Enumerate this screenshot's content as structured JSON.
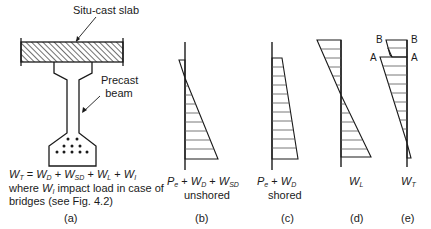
{
  "figure": {
    "panel_a": {
      "slab_label": "Situ-cast slab",
      "beam_label_line1": "Precast",
      "beam_label_line2": "beam",
      "formula": "W_T = W_D + W_SD + W_L + W_I",
      "formula_parts": {
        "wt": "W",
        "wt_sub": "T",
        "eq": " = ",
        "wd": "W",
        "wd_sub": "D",
        "plus1": " + ",
        "wsd": "W",
        "wsd_sub": "SD",
        "plus2": " + ",
        "wl": "W",
        "wl_sub": "L",
        "plus3": " + ",
        "wi": "W",
        "wi_sub": "I"
      },
      "note_line1_pre": "where ",
      "note_w": "W",
      "note_w_sub": "I",
      "note_line1_post": " impact load in case of",
      "note_line2": "bridges (see Fig. 4.2)",
      "caption": "(a)"
    },
    "panel_b": {
      "label_p": "P",
      "label_p_sub": "e",
      "label_rest1": " + ",
      "label_wd": "W",
      "label_wd_sub": "D",
      "label_rest2": " + ",
      "label_wsd": "W",
      "label_wsd_sub": "SD",
      "sublabel": "unshored",
      "caption": "(b)"
    },
    "panel_c": {
      "label_p": "P",
      "label_p_sub": "e",
      "label_rest1": " + ",
      "label_wd": "W",
      "label_wd_sub": "D",
      "sublabel": "shored",
      "caption": "(c)"
    },
    "panel_d": {
      "label_w": "W",
      "label_w_sub": "L",
      "caption": "(d)"
    },
    "panel_e": {
      "label_w": "W",
      "label_w_sub": "T",
      "point_b_left": "B",
      "point_b_right": "B",
      "point_a_left": "A",
      "point_a_right": "A",
      "caption": "(e)"
    }
  },
  "colors": {
    "line": "#1a1a1a",
    "hatch": "#444444"
  }
}
